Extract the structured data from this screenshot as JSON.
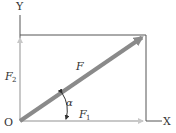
{
  "diagram": {
    "type": "force-decomposition",
    "labels": {
      "y_axis": "Y",
      "x_axis": "X",
      "origin": "O",
      "resultant": "F",
      "component_y": "F",
      "component_y_sub": "2",
      "component_x": "F",
      "component_x_sub": "1",
      "angle": "α"
    },
    "colors": {
      "axis_line": "#555555",
      "resultant": "#8a8a8a",
      "components": "#c8c8c8",
      "text": "#333333"
    }
  }
}
